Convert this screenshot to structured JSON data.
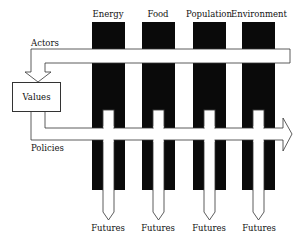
{
  "diagram": {
    "columns": [
      {
        "label": "Energy",
        "x": 92
      },
      {
        "label": "Food",
        "x": 142
      },
      {
        "label": "Population",
        "x": 193
      },
      {
        "label": "Environment",
        "x": 242
      }
    ],
    "bands": {
      "actors_label": "Actors",
      "policies_label": "Policies"
    },
    "values_box": "Values",
    "outputs": [
      "Futures",
      "Futures",
      "Futures",
      "Futures"
    ],
    "colors": {
      "bar": "#0a0a0a",
      "band_fill": "#ffffff",
      "stroke": "#333333"
    }
  }
}
